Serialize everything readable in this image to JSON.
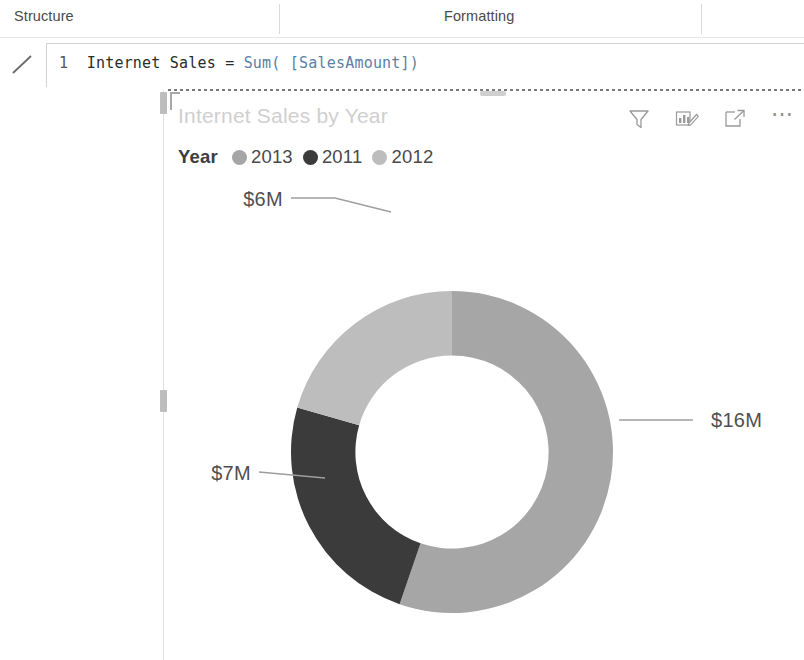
{
  "ribbon": {
    "tabs": [
      {
        "label": "Structure"
      },
      {
        "label": "Formatting"
      }
    ]
  },
  "formula_bar": {
    "commit_icon": "checkmark-icon",
    "line_number": "1",
    "measure_name": "Internet Sales",
    "equals": " = ",
    "function_name": "Sum(",
    "argument": " [SalesAmount])",
    "full_text": "1  Internet Sales = Sum( [SalesAmount])"
  },
  "visual": {
    "title": "Internet Sales by Year",
    "header_icons": [
      {
        "name": "filter-icon",
        "tooltip": "Filters"
      },
      {
        "name": "personalize-visual-icon",
        "tooltip": "Personalize this visual"
      },
      {
        "name": "focus-mode-icon",
        "tooltip": "Focus mode"
      },
      {
        "name": "more-options-icon",
        "tooltip": "More options"
      }
    ],
    "legend": {
      "title": "Year",
      "items": [
        {
          "label": "2013",
          "color": "#a6a6a6"
        },
        {
          "label": "2011",
          "color": "#3b3b3b"
        },
        {
          "label": "2012",
          "color": "#bdbdbd"
        }
      ]
    }
  },
  "chart_data": {
    "type": "pie",
    "variant": "donut",
    "title": "Internet Sales by Year",
    "legend_title": "Year",
    "legend_position": "top",
    "measure": "Internet Sales",
    "value_unit": "USD millions",
    "total_label": "$29M",
    "categories": [
      "2013",
      "2011",
      "2012"
    ],
    "values": [
      16,
      7,
      6
    ],
    "data_labels": [
      "$16M",
      "$7M",
      "$6M"
    ],
    "colors": [
      "#a6a6a6",
      "#3b3b3b",
      "#bdbdbd"
    ],
    "slices": [
      {
        "category": "2013",
        "value": 16,
        "label": "$16M",
        "color": "#a6a6a6",
        "start_angle": 0,
        "end_angle": 199,
        "percent": 55.2
      },
      {
        "category": "2011",
        "value": 7,
        "label": "$7M",
        "color": "#3b3b3b",
        "start_angle": 199,
        "end_angle": 286,
        "percent": 24.1
      },
      {
        "category": "2012",
        "value": 6,
        "label": "$6M",
        "color": "#bdbdbd",
        "start_angle": 286,
        "end_angle": 360,
        "percent": 20.7
      }
    ],
    "inner_radius_ratio": 0.6,
    "grid": false
  }
}
